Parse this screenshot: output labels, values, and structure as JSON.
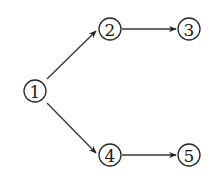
{
  "diagram": {
    "type": "directed-graph",
    "nodes": [
      {
        "id": "1",
        "label": "1",
        "x": 35,
        "y": 91
      },
      {
        "id": "2",
        "label": "2",
        "x": 110,
        "y": 29
      },
      {
        "id": "3",
        "label": "3",
        "x": 189,
        "y": 29
      },
      {
        "id": "4",
        "label": "4",
        "x": 110,
        "y": 155
      },
      {
        "id": "5",
        "label": "5",
        "x": 189,
        "y": 155
      }
    ],
    "edges": [
      {
        "from": "1",
        "to": "2"
      },
      {
        "from": "2",
        "to": "3"
      },
      {
        "from": "1",
        "to": "4"
      },
      {
        "from": "4",
        "to": "5"
      }
    ],
    "colors": {
      "stroke": "#2a2a2a",
      "background": "#ffffff"
    }
  }
}
